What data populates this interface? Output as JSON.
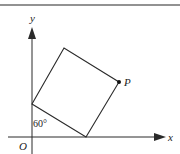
{
  "diagram": {
    "type": "coordinate-geometry",
    "labels": {
      "origin": "O",
      "x_axis": "x",
      "y_axis": "y",
      "point": "P",
      "angle": "60°"
    },
    "colors": {
      "stroke": "#2a2a2a",
      "rule": "#6e6e6e",
      "background": "#ffffff"
    },
    "vertices": {
      "on_y_axis": [
        32,
        104
      ],
      "on_x_axis": [
        86,
        137
      ],
      "P": [
        119,
        82
      ],
      "top": [
        64,
        48
      ]
    }
  }
}
